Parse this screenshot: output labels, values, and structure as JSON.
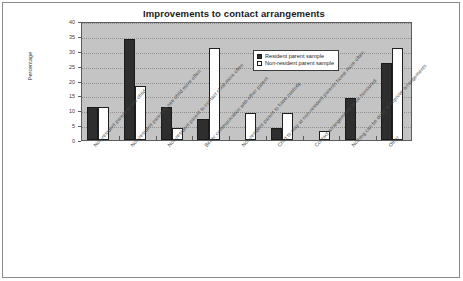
{
  "chart_data": {
    "type": "bar",
    "title": "Improvements to contact arrangements",
    "xlabel": "",
    "ylabel": "Percentage",
    "ylim": [
      0,
      40
    ],
    "ytick_step": 5,
    "yticks": [
      0,
      5,
      10,
      15,
      20,
      25,
      30,
      35,
      40
    ],
    "grid": true,
    "legend_position": "upper right inside",
    "categories": [
      "Non-resident parent to see child",
      "Non-resident parent to see child more often",
      "Non-resident parent to contact child more often",
      "Better communication with other parent",
      "Non-resident parent to have custody",
      "Child to stay at non-resident parents home more often",
      "Contact arrangements to be honoured",
      "Nothing can be done to improve arrangements",
      "Other"
    ],
    "series": [
      {
        "name": "Resident parent sample",
        "color": "#2e2e2e",
        "values": [
          11,
          34,
          11,
          7,
          0,
          4,
          0,
          14,
          26
        ]
      },
      {
        "name": "Non-resident parent sample",
        "color": "#ffffff",
        "values": [
          11,
          18,
          4,
          31,
          9,
          9,
          3,
          0,
          31
        ]
      }
    ]
  },
  "legend": {
    "items": [
      {
        "label": "Resident parent sample"
      },
      {
        "label": "Non-resident parent sample"
      }
    ]
  }
}
